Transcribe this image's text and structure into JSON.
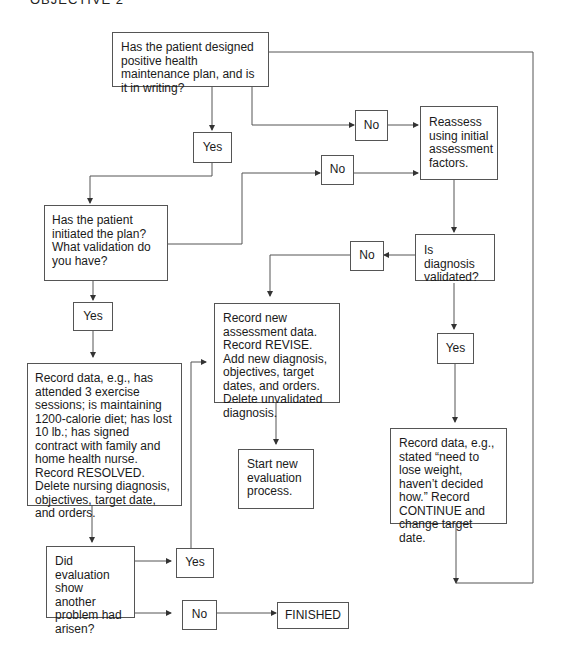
{
  "header": {
    "title": "OBJECTIVE 2"
  },
  "nodes": {
    "q_plan": "Has the patient designed positive health maintenance plan, and is it in writing?",
    "reassess": "Reassess using initial assessment factors.",
    "q_initiated": "Has the patient initiated the plan? What validation do you have?",
    "q_validated": "Is diagnosis validated?",
    "record_resolved": "Record data, e.g., has attended 3 exercise sessions; is maintaining 1200-calorie diet; has lost 10 lb.; has signed contract with family and home health nurse.  Record RESOLVED. Delete nursing diagnosis, objectives, target date, and orders.",
    "record_revise": "Record new assessment data. Record REVISE. Add new diagnosis, objectives, target dates, and orders. Delete unvalidated diagnosis.",
    "start_new": "Start new evaluation process.",
    "record_continue": "Record data, e.g., stated “need to lose weight, haven’t decided how.” Record CONTINUE and change target date.",
    "q_another": "Did evaluation show another problem had arisen?",
    "finished": "FINISHED"
  },
  "labels": {
    "yes_1": "Yes",
    "no_1": "No",
    "yes_2": "Yes",
    "no_2": "No",
    "no_3": "No",
    "yes_3": "Yes",
    "yes_4": "Yes",
    "no_4": "No"
  }
}
